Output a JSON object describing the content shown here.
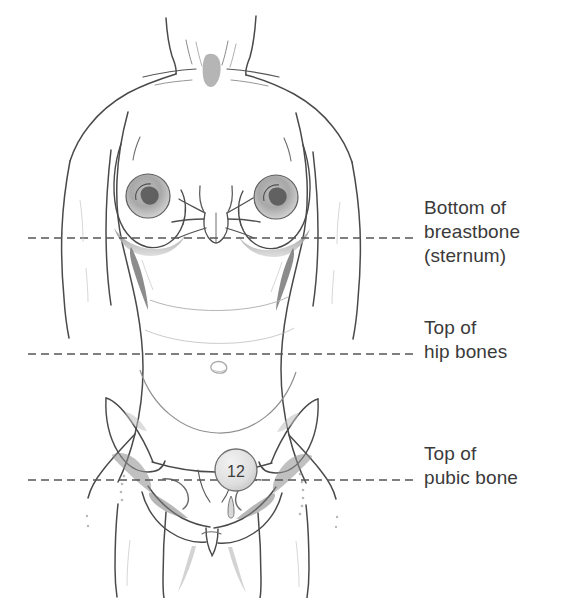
{
  "figure": {
    "background_color": "#ffffff",
    "line_color": "#444444",
    "dash_color": "#555555",
    "text_color": "#3a3a3a",
    "marker": {
      "name": "device-marker",
      "value": "12",
      "fill": "#e3e3e3",
      "stroke": "#6a6a6a"
    }
  },
  "reference_lines": [
    {
      "id": "sternum",
      "y": 238,
      "label": "Bottom of\nbreastbone\n(sternum)"
    },
    {
      "id": "hip",
      "y": 354,
      "label": "Top of\nhip bones"
    },
    {
      "id": "pubic",
      "y": 480,
      "label": "Top of\npubic bone"
    }
  ],
  "labels": {
    "sternum": "Bottom of\nbreastbone\n(sternum)",
    "hip": "Top of\nhip bones",
    "pubic": "Top of\npubic bone"
  }
}
